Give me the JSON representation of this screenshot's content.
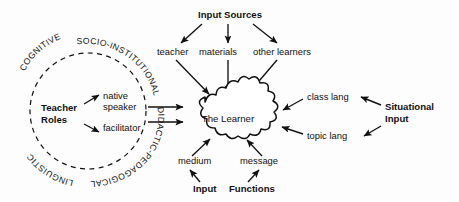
{
  "diagram": {
    "title_center": "The Learner",
    "groups": {
      "input_sources": {
        "heading": "Input Sources",
        "items": [
          "teacher",
          "materials",
          "other learners"
        ]
      },
      "teacher_roles": {
        "heading_line1": "Teacher",
        "heading_line2": "Roles",
        "items": [
          "native speaker",
          "facilitator"
        ],
        "item1_line1": "native",
        "item1_line2": "speaker",
        "item2_line1": "facilitator",
        "ring_labels": [
          "COGNITIVE",
          "SOCIO-INSTITUTIONAL",
          "DIDACTIC-PEDAGOGICAL",
          "LINGUISTIC"
        ],
        "ring_full_text": "COGNITIVE SOCIO-INSTITUTIONAL DIDACTIC-PEDAGOGICAL LINGUISTIC"
      },
      "situational_input": {
        "heading_line1": "Situational",
        "heading_line2": "Input",
        "items": [
          "class lang",
          "topic lang"
        ]
      },
      "input_functions": {
        "heading_word1": "Input",
        "heading_word2": "Functions",
        "items": [
          "medium",
          "message"
        ]
      }
    },
    "colors": {
      "stroke": "#111111",
      "background": "#fdfdfd",
      "cloud_fill": "#ffffff"
    }
  }
}
